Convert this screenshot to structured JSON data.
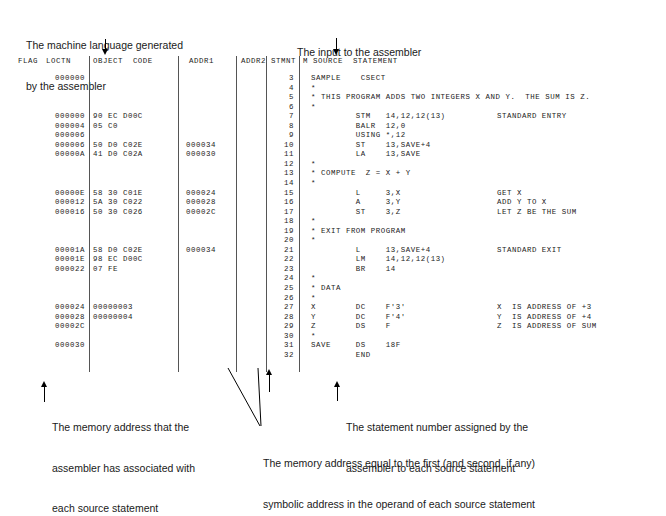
{
  "figure": {
    "title_annotations": {
      "machine_language": [
        "The machine language generated",
        "by the assembler"
      ],
      "input_to_assembler": [
        "The input to the assembler"
      ]
    },
    "bottom_annotations": {
      "memory_address_loctn": [
        "The memory address that the",
        "assembler has associated with",
        "each source statement"
      ],
      "statement_number": [
        "The statement number assigned by the",
        "assembler to each source statement"
      ],
      "addr_operand": [
        "The memory address equal to the first (and second, if any)",
        "symbolic address in the operand of each source statement"
      ]
    }
  },
  "listing": {
    "headers": {
      "flag": "FLAG",
      "loctn": "LOCTN",
      "object_code": "OBJECT  CODE",
      "addr1": "ADDR1",
      "addr2": "ADDR2",
      "stmnt": "STMNT",
      "m": "M",
      "source_statement": "SOURCE  STATEMENT"
    },
    "rows": [
      {
        "loctn": "000000",
        "obj": "",
        "addr1": "",
        "addr2": "",
        "stmnt": "3",
        "src": "SAMPLE    CSECT",
        "cmt": ""
      },
      {
        "loctn": "",
        "obj": "",
        "addr1": "",
        "addr2": "",
        "stmnt": "4",
        "src": "*",
        "cmt": ""
      },
      {
        "loctn": "",
        "obj": "",
        "addr1": "",
        "addr2": "",
        "stmnt": "5",
        "src": "* THIS PROGRAM ADDS TWO INTEGERS X AND Y.  THE SUM IS Z.",
        "cmt": ""
      },
      {
        "loctn": "",
        "obj": "",
        "addr1": "",
        "addr2": "",
        "stmnt": "6",
        "src": "*",
        "cmt": ""
      },
      {
        "loctn": "000000",
        "obj": "90 EC D00C",
        "addr1": "",
        "addr2": "",
        "stmnt": "7",
        "src": "         STM   14,12,12(13)",
        "cmt": "STANDARD ENTRY"
      },
      {
        "loctn": "000004",
        "obj": "05 C0",
        "addr1": "",
        "addr2": "",
        "stmnt": "8",
        "src": "         BALR  12,0",
        "cmt": ""
      },
      {
        "loctn": "000006",
        "obj": "",
        "addr1": "",
        "addr2": "",
        "stmnt": "9",
        "src": "         USING *,12",
        "cmt": ""
      },
      {
        "loctn": "000006",
        "obj": "50 D0 C02E",
        "addr1": "000034",
        "addr2": "",
        "stmnt": "10",
        "src": "         ST    13,SAVE+4",
        "cmt": ""
      },
      {
        "loctn": "00000A",
        "obj": "41 D0 C02A",
        "addr1": "000030",
        "addr2": "",
        "stmnt": "11",
        "src": "         LA    13,SAVE",
        "cmt": ""
      },
      {
        "loctn": "",
        "obj": "",
        "addr1": "",
        "addr2": "",
        "stmnt": "12",
        "src": "*",
        "cmt": ""
      },
      {
        "loctn": "",
        "obj": "",
        "addr1": "",
        "addr2": "",
        "stmnt": "13",
        "src": "* COMPUTE  Z = X + Y",
        "cmt": ""
      },
      {
        "loctn": "",
        "obj": "",
        "addr1": "",
        "addr2": "",
        "stmnt": "14",
        "src": "*",
        "cmt": ""
      },
      {
        "loctn": "00000E",
        "obj": "58 30 C01E",
        "addr1": "000024",
        "addr2": "",
        "stmnt": "15",
        "src": "         L     3,X",
        "cmt": "GET X"
      },
      {
        "loctn": "000012",
        "obj": "5A 30 C022",
        "addr1": "000028",
        "addr2": "",
        "stmnt": "16",
        "src": "         A     3,Y",
        "cmt": "ADD Y TO X"
      },
      {
        "loctn": "000016",
        "obj": "50 30 C026",
        "addr1": "00002C",
        "addr2": "",
        "stmnt": "17",
        "src": "         ST    3,Z",
        "cmt": "LET Z BE THE SUM"
      },
      {
        "loctn": "",
        "obj": "",
        "addr1": "",
        "addr2": "",
        "stmnt": "18",
        "src": "*",
        "cmt": ""
      },
      {
        "loctn": "",
        "obj": "",
        "addr1": "",
        "addr2": "",
        "stmnt": "19",
        "src": "* EXIT FROM PROGRAM",
        "cmt": ""
      },
      {
        "loctn": "",
        "obj": "",
        "addr1": "",
        "addr2": "",
        "stmnt": "20",
        "src": "*",
        "cmt": ""
      },
      {
        "loctn": "00001A",
        "obj": "58 D0 C02E",
        "addr1": "000034",
        "addr2": "",
        "stmnt": "21",
        "src": "         L     13,SAVE+4",
        "cmt": "STANDARD EXIT"
      },
      {
        "loctn": "00001E",
        "obj": "98 EC D00C",
        "addr1": "",
        "addr2": "",
        "stmnt": "22",
        "src": "         LM    14,12,12(13)",
        "cmt": ""
      },
      {
        "loctn": "000022",
        "obj": "07 FE",
        "addr1": "",
        "addr2": "",
        "stmnt": "23",
        "src": "         BR    14",
        "cmt": ""
      },
      {
        "loctn": "",
        "obj": "",
        "addr1": "",
        "addr2": "",
        "stmnt": "24",
        "src": "*",
        "cmt": ""
      },
      {
        "loctn": "",
        "obj": "",
        "addr1": "",
        "addr2": "",
        "stmnt": "25",
        "src": "* DATA",
        "cmt": ""
      },
      {
        "loctn": "",
        "obj": "",
        "addr1": "",
        "addr2": "",
        "stmnt": "26",
        "src": "*",
        "cmt": ""
      },
      {
        "loctn": "000024",
        "obj": "00000003",
        "addr1": "",
        "addr2": "",
        "stmnt": "27",
        "src": "X        DC    F'3'",
        "cmt": "X  IS ADDRESS OF +3"
      },
      {
        "loctn": "000028",
        "obj": "00000004",
        "addr1": "",
        "addr2": "",
        "stmnt": "28",
        "src": "Y        DC    F'4'",
        "cmt": "Y  IS ADDRESS OF +4"
      },
      {
        "loctn": "00002C",
        "obj": "",
        "addr1": "",
        "addr2": "",
        "stmnt": "29",
        "src": "Z        DS    F",
        "cmt": "Z  IS ADDRESS OF SUM"
      },
      {
        "loctn": "",
        "obj": "",
        "addr1": "",
        "addr2": "",
        "stmnt": "30",
        "src": "*",
        "cmt": ""
      },
      {
        "loctn": "000030",
        "obj": "",
        "addr1": "",
        "addr2": "",
        "stmnt": "31",
        "src": "SAVE     DS    18F",
        "cmt": ""
      },
      {
        "loctn": "",
        "obj": "",
        "addr1": "",
        "addr2": "",
        "stmnt": "32",
        "src": "         END",
        "cmt": ""
      }
    ]
  }
}
